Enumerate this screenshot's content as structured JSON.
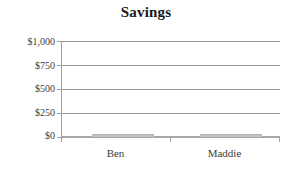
{
  "chart_data": {
    "type": "bar",
    "title": "Savings",
    "xlabel": "",
    "ylabel": "",
    "categories": [
      "Ben",
      "Maddie"
    ],
    "values": [
      15,
      20
    ],
    "value_labels": [
      "",
      ""
    ],
    "ylim": [
      0,
      1000
    ],
    "yticks": [
      0,
      250,
      500,
      750,
      1000
    ],
    "ytick_labels": [
      "$0",
      "$250",
      "$500",
      "$750",
      "$1,000"
    ],
    "grid": true,
    "legend": false,
    "legend_position": "none",
    "series": [
      {
        "name": "Savings",
        "values": [
          15,
          20
        ],
        "color": "#c2c2c2"
      }
    ],
    "colors": {
      "bar": "#c2c2c2",
      "gridline": "#9a9a9a",
      "axis": "#9e9e9e",
      "title_text": "#1a1a1a",
      "tick_text": "#3d3d3d",
      "background": "#ffffff"
    }
  },
  "axes": {
    "y_ticks": [
      {
        "label": "$1,000",
        "value": 1000
      },
      {
        "label": "$750",
        "value": 750
      },
      {
        "label": "$500",
        "value": 500
      },
      {
        "label": "$250",
        "value": 250
      },
      {
        "label": "$0",
        "value": 0
      }
    ],
    "x_ticks": [
      {
        "label": "Ben"
      },
      {
        "label": "Maddie"
      }
    ]
  }
}
